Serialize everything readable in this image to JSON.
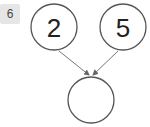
{
  "problem_number": "6",
  "number_bond": {
    "left_part": "2",
    "right_part": "5",
    "whole": ""
  },
  "colors": {
    "circle_stroke": "#555555",
    "arrow": "#666666",
    "badge_bg": "#e6e6e6"
  }
}
